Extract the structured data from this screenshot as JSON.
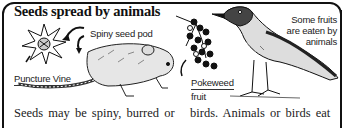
{
  "title": "Seeds spread by animals",
  "labels": {
    "spiny_seed_pod": "Spiny seed pod",
    "puncture_vine": "Puncture Vine",
    "pokeweed_line1": "Pokeweed",
    "pokeweed_line2": "fruit",
    "fruits_eaten_line1": "Some fruits",
    "fruits_eaten_line2": "are eaten by",
    "fruits_eaten_line3": "animals"
  },
  "body_text": {
    "left_column": "Seeds may be spiny, burred or",
    "right_column": "birds. Animals or birds eat"
  },
  "illustrations": [
    "puncture-vine-seed-pod",
    "rat",
    "pokeweed-berries",
    "bird"
  ]
}
